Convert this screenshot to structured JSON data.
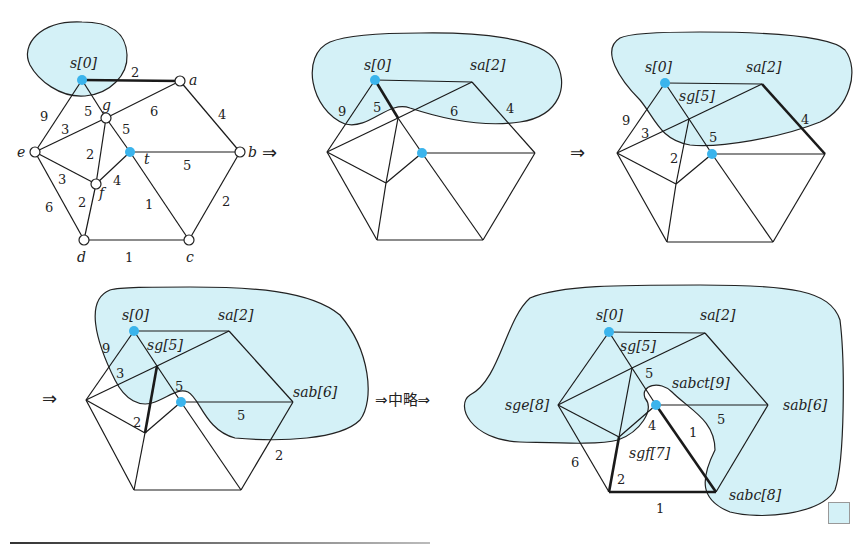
{
  "figure": {
    "colors": {
      "region_fill": "#d4f1f7",
      "highlight_node": "#3bb4ec",
      "edge": "#1a1a1a"
    },
    "arrows": {
      "a1": "⇒",
      "a2": "⇒",
      "a3": "⇒",
      "a4": "⇒中略⇒"
    },
    "graph1": {
      "node_labels": {
        "s": "s[0]",
        "a": "a",
        "b": "b",
        "c": "c",
        "d": "d",
        "e": "e",
        "f": "f",
        "g": "g",
        "t": "t"
      },
      "edge_weights": {
        "sa": "2",
        "se": "9",
        "sg": "5",
        "ga": "6",
        "ab": "4",
        "eg": "3",
        "gt": "5",
        "tb": "5",
        "gf": "2",
        "ef": "3",
        "ft": "4",
        "ed": "6",
        "fd": "2",
        "tc": "1",
        "bc": "2",
        "dc": "1"
      }
    },
    "graph2": {
      "node_labels": {
        "s": "s[0]",
        "a": "sa[2]"
      },
      "edge_weights": {
        "se": "9",
        "sg": "5",
        "ga": "6",
        "ab": "4"
      }
    },
    "graph3": {
      "node_labels": {
        "s": "s[0]",
        "a": "sa[2]",
        "g": "sg[5]"
      },
      "edge_weights": {
        "se": "9",
        "eg": "3",
        "gf": "2",
        "gt": "5",
        "ab": "4"
      }
    },
    "graph4": {
      "node_labels": {
        "s": "s[0]",
        "a": "sa[2]",
        "g": "sg[5]",
        "b": "sab[6]"
      },
      "edge_weights": {
        "se": "9",
        "eg": "3",
        "gf": "2",
        "gt": "5",
        "tb": "5",
        "bc": "2"
      }
    },
    "graph5": {
      "node_labels": {
        "s": "s[0]",
        "a": "sa[2]",
        "g": "sg[5]",
        "e": "sge[8]",
        "b": "sab[6]",
        "t": "sabct[9]",
        "f": "sgf[7]",
        "c": "sabc[8]"
      },
      "edge_weights": {
        "gt": "5",
        "tb": "5",
        "ft": "4",
        "tc": "1",
        "ed": "6",
        "fd": "2",
        "dc": "1"
      }
    },
    "end_marker": "□"
  }
}
